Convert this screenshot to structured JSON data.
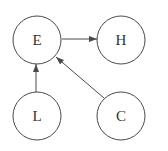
{
  "diagram": {
    "type": "directed-graph",
    "colors": {
      "stroke": "#4a4a4a",
      "text": "#333333",
      "background": "#ffffff"
    },
    "nodes": [
      {
        "id": "E",
        "label": "E",
        "cx": 37,
        "cy": 40,
        "r": 24
      },
      {
        "id": "H",
        "label": "H",
        "cx": 121,
        "cy": 40,
        "r": 24
      },
      {
        "id": "L",
        "label": "L",
        "cx": 37,
        "cy": 116,
        "r": 24
      },
      {
        "id": "C",
        "label": "C",
        "cx": 121,
        "cy": 116,
        "r": 24
      }
    ],
    "edges": [
      {
        "from": "E",
        "to": "H"
      },
      {
        "from": "L",
        "to": "E"
      },
      {
        "from": "C",
        "to": "E"
      }
    ]
  }
}
